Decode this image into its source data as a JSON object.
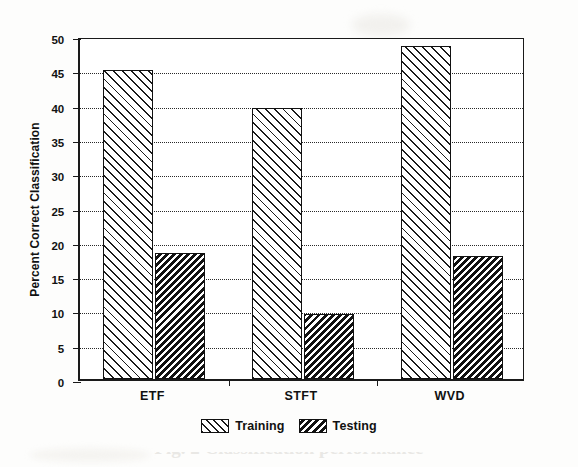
{
  "chart_data": {
    "type": "bar",
    "title": "",
    "xlabel": "",
    "ylabel": "Percent Correct Classification",
    "categories": [
      "ETF",
      "STFT",
      "WVD"
    ],
    "series": [
      {
        "name": "Training",
        "values": [
          45.0,
          39.5,
          48.5
        ]
      },
      {
        "name": "Testing",
        "values": [
          18.3,
          9.5,
          18.0
        ]
      }
    ],
    "ylim": [
      0,
      50
    ],
    "ytick_values": [
      0,
      5,
      10,
      15,
      20,
      25,
      30,
      35,
      40,
      45,
      50
    ],
    "ytick_labels": [
      "0",
      "5",
      "10",
      "15",
      "20",
      "25",
      "30",
      "35",
      "40",
      "45",
      "50"
    ],
    "grid": "horizontal-dotted",
    "legend_position": "below-axis-center",
    "legend_entries": [
      {
        "label": "Training",
        "pattern": "light-forward-diagonal-hatch"
      },
      {
        "label": "Testing",
        "pattern": "dense-black-backward-diagonal-hatch"
      }
    ],
    "colors": {
      "axis": "#111111",
      "gridline": "#2a2a2a",
      "training_fill": "#ffffff",
      "training_hatch": "#1b1b1b",
      "testing_fill": "#111111",
      "testing_hatch": "#ffffff",
      "background": "#fdfdfc"
    }
  },
  "caption": {
    "text": "Fig. 2 Classification performance"
  }
}
